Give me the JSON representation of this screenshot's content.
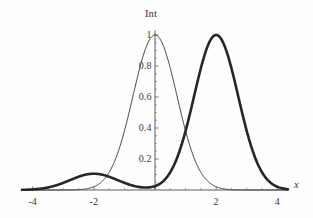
{
  "chart_data": {
    "type": "line",
    "title": "Int",
    "xlabel": "x",
    "ylabel": "Int",
    "xlim": [
      -4.35,
      4.35
    ],
    "ylim": [
      0,
      1.06
    ],
    "grid": false,
    "legend": "none",
    "axis_style": "mathematica-cross-axes",
    "xticks": [
      -4,
      -2,
      0,
      2,
      4
    ],
    "xtick_labels": [
      "-4",
      "-2",
      "",
      "2",
      "4"
    ],
    "yticks": [
      0.2,
      0.4,
      0.6,
      0.8,
      1.0
    ],
    "ytick_labels": [
      "0.2",
      "0.4",
      "0.6",
      "0.8",
      "1"
    ],
    "xtick_minor_step": 0.5,
    "ytick_minor_step": 0.05,
    "series": [
      {
        "name": "thin-curve",
        "style": "thin",
        "color": "#3a3a3a",
        "linewidth": 0.95,
        "description": "single gaussian peak centered at x = 0",
        "peaks": [
          {
            "center": 0.0,
            "height": 1.0,
            "sigma": 0.72
          }
        ]
      },
      {
        "name": "thick-curve",
        "style": "thick",
        "color": "#262626",
        "linewidth": 2.6,
        "description": "main gaussian peak centered at x = 2 with a small satellite bump at x = -2",
        "peaks": [
          {
            "center": 2.0,
            "height": 1.0,
            "sigma": 0.72
          },
          {
            "center": -2.0,
            "height": 0.105,
            "sigma": 0.78
          }
        ]
      }
    ]
  },
  "labels": {
    "y_axis_title": "Int",
    "x_axis_title": "x",
    "y_ticks": [
      "0.2",
      "0.4",
      "0.6",
      "0.8",
      "1"
    ],
    "x_ticks": [
      "-4",
      "-2",
      "2",
      "4"
    ]
  },
  "colors": {
    "background": "#fefefe",
    "axis": "#4a4a4a",
    "thin_curve": "#3a3a3a",
    "thick_curve": "#262626",
    "text": "#39393c"
  }
}
